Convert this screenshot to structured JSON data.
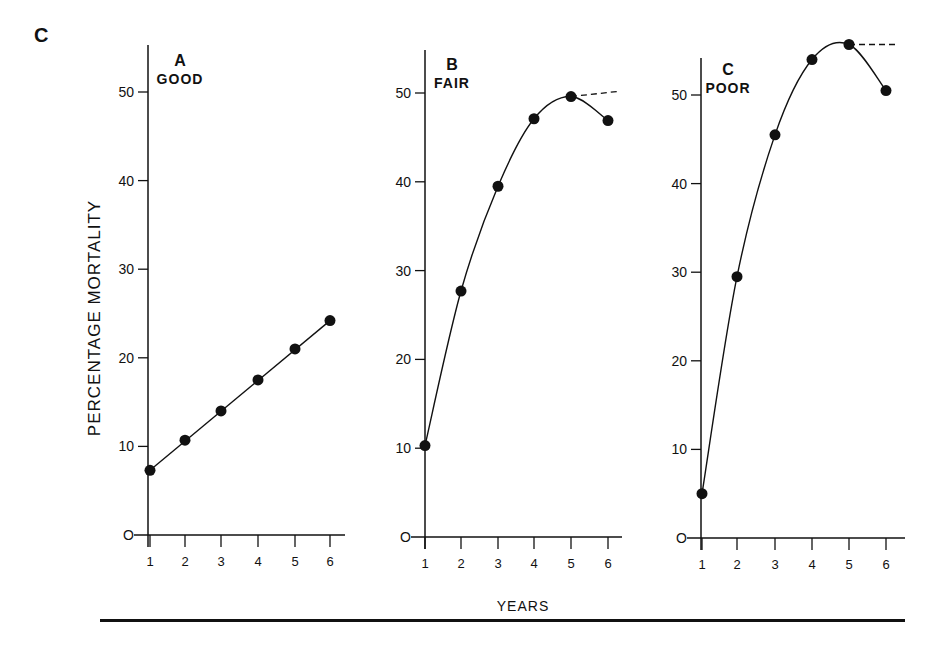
{
  "figure": {
    "letter": "C",
    "ylabel": "PERCENTAGE MORTALITY",
    "xlabel": "YEARS"
  },
  "chart_data": [
    {
      "type": "line",
      "panel": "A",
      "title": "GOOD",
      "x": [
        1,
        2,
        3,
        4,
        5,
        6
      ],
      "values": [
        7.3,
        10.7,
        14.0,
        17.5,
        21.0,
        24.2
      ],
      "fit": "linear",
      "xlabel": "YEARS",
      "ylabel": "PERCENTAGE MORTALITY",
      "xticks": [
        1,
        2,
        3,
        4,
        5,
        6
      ],
      "yticks": [
        0,
        10,
        20,
        30,
        40,
        50
      ],
      "ylim": [
        0,
        52
      ],
      "grid": false
    },
    {
      "type": "line",
      "panel": "B",
      "title": "FAIR",
      "x": [
        1,
        2,
        3,
        4,
        5,
        6
      ],
      "values": [
        10.3,
        27.7,
        39.5,
        47.1,
        49.6,
        46.9
      ],
      "fit": "curve",
      "dashed_extension": {
        "from": [
          5,
          49.6
        ],
        "to": [
          6,
          50.2
        ]
      },
      "xlabel": "YEARS",
      "ylabel": "PERCENTAGE MORTALITY",
      "xticks": [
        1,
        2,
        3,
        4,
        5,
        6
      ],
      "yticks": [
        0,
        10,
        20,
        30,
        40,
        50
      ],
      "ylim": [
        0,
        52
      ],
      "grid": false
    },
    {
      "type": "line",
      "panel": "C",
      "title": "POOR",
      "x": [
        1,
        2,
        3,
        4,
        5,
        6
      ],
      "values": [
        5.0,
        29.5,
        45.5,
        54.0,
        55.7,
        50.5
      ],
      "fit": "curve",
      "dashed_extension": {
        "from": [
          5,
          55.7
        ],
        "to": [
          6,
          55.7
        ]
      },
      "xlabel": "YEARS",
      "ylabel": "PERCENTAGE MORTALITY",
      "xticks": [
        1,
        2,
        3,
        4,
        5,
        6
      ],
      "yticks": [
        0,
        10,
        20,
        30,
        40,
        50
      ],
      "ylim": [
        0,
        57
      ],
      "grid": false
    }
  ]
}
